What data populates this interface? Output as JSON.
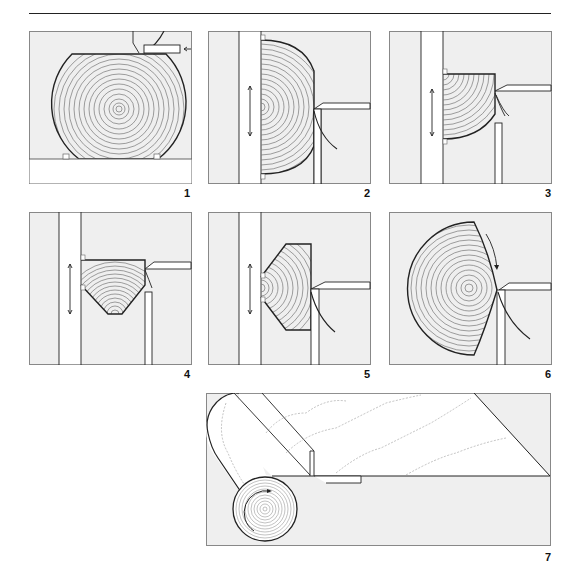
{
  "figure": {
    "colors": {
      "background": "#efefef",
      "line": "#222222",
      "ring": "#777777",
      "white": "#ffffff"
    },
    "panels": [
      {
        "label": "1",
        "content": "round log on carriage, saw blade at top, arrow pointing left"
      },
      {
        "label": "2",
        "content": "half log against fence, double vertical arrow, blade cutting right edge"
      },
      {
        "label": "3",
        "content": "quarter log against fence, double vertical arrow"
      },
      {
        "label": "4",
        "content": "pentagonal section against fence, double vertical arrow"
      },
      {
        "label": "5",
        "content": "hexagonal flitch against fence, double vertical arrow"
      },
      {
        "label": "6",
        "content": "log segment rotating, curved arrow, blade cutting"
      },
      {
        "label": "7",
        "content": "rotary-cut veneer sheet unrolling from log, rotation arrow"
      }
    ]
  }
}
